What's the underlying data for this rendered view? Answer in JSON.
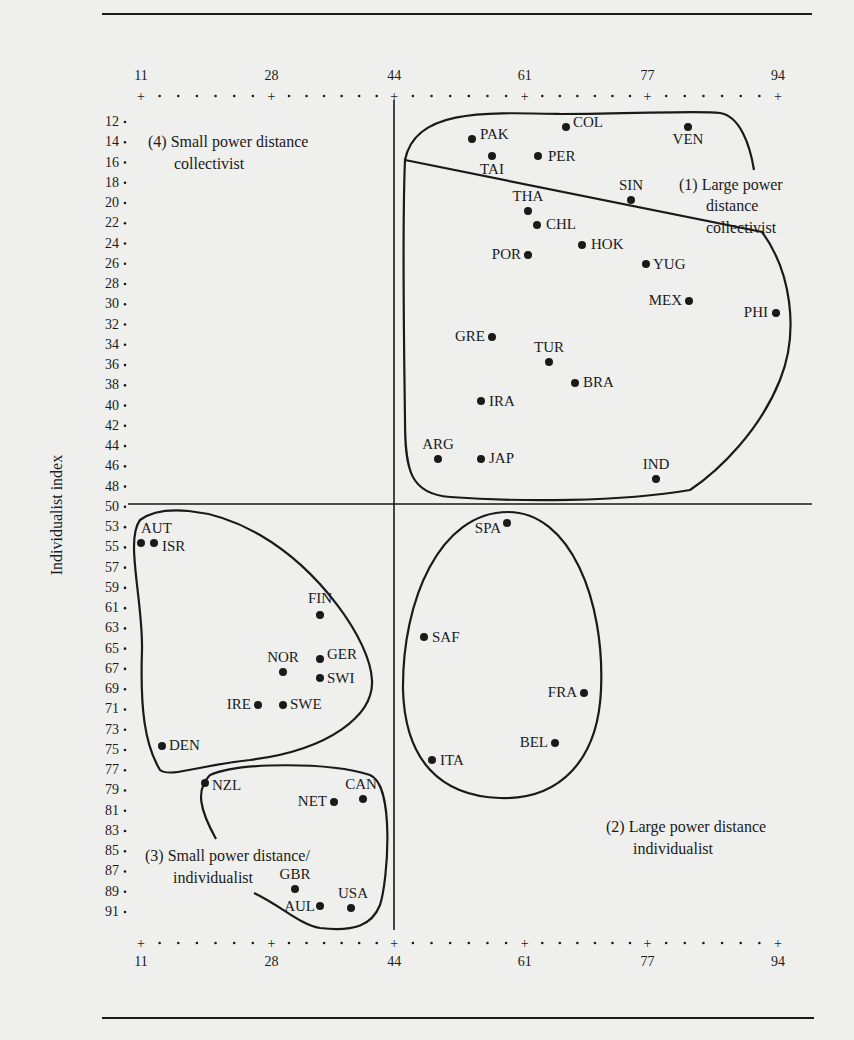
{
  "chart_data": {
    "type": "scatter",
    "title": "",
    "xlabel": "Power distance index",
    "ylabel": "Individualist index",
    "x_ticks": [
      11,
      28,
      44,
      61,
      77,
      94
    ],
    "y_ticks": [
      12,
      14,
      16,
      18,
      20,
      22,
      24,
      26,
      28,
      30,
      32,
      34,
      36,
      38,
      40,
      42,
      44,
      46,
      48,
      50,
      53,
      55,
      57,
      59,
      61,
      63,
      65,
      67,
      69,
      71,
      73,
      75,
      77,
      79,
      81,
      83,
      85,
      87,
      89,
      91
    ],
    "xlim": [
      11,
      94
    ],
    "ylim": [
      12,
      91
    ],
    "y_inverted": true,
    "divider_x": 44,
    "divider_y": 50,
    "regions": [
      {
        "id": "1",
        "label_line1": "(1) Large power",
        "label_line2": "distance",
        "label_line3": "collectivist"
      },
      {
        "id": "2",
        "label_line1": "(2) Large power distance",
        "label_line2": "individualist"
      },
      {
        "id": "3",
        "label_line1": "(3) Small power distance/",
        "label_line2": "individualist"
      },
      {
        "id": "4",
        "label_line1": "(4) Small power distance",
        "label_line2": "collectivist"
      }
    ],
    "points": [
      {
        "label": "PAK",
        "x": 55,
        "y": 14,
        "region": "1"
      },
      {
        "label": "COL",
        "x": 67,
        "y": 13,
        "region": "1"
      },
      {
        "label": "VEN",
        "x": 81,
        "y": 12,
        "region": "1"
      },
      {
        "label": "TAI",
        "x": 58,
        "y": 17,
        "region": "1"
      },
      {
        "label": "PER",
        "x": 64,
        "y": 16,
        "region": "1"
      },
      {
        "label": "SIN",
        "x": 74,
        "y": 20,
        "region": "1"
      },
      {
        "label": "THA",
        "x": 64,
        "y": 20,
        "region": "1"
      },
      {
        "label": "CHL",
        "x": 63,
        "y": 23,
        "region": "1"
      },
      {
        "label": "HOK",
        "x": 68,
        "y": 25,
        "region": "1"
      },
      {
        "label": "POR",
        "x": 63,
        "y": 27,
        "region": "1"
      },
      {
        "label": "YUG",
        "x": 76,
        "y": 27,
        "region": "1"
      },
      {
        "label": "MEX",
        "x": 81,
        "y": 30,
        "region": "1"
      },
      {
        "label": "PHI",
        "x": 94,
        "y": 32,
        "region": "1"
      },
      {
        "label": "GRE",
        "x": 60,
        "y": 35,
        "region": "1"
      },
      {
        "label": "TUR",
        "x": 66,
        "y": 37,
        "region": "1"
      },
      {
        "label": "BRA",
        "x": 69,
        "y": 38,
        "region": "1"
      },
      {
        "label": "IRA",
        "x": 58,
        "y": 41,
        "region": "1"
      },
      {
        "label": "ARG",
        "x": 49,
        "y": 46,
        "region": "1"
      },
      {
        "label": "JAP",
        "x": 54,
        "y": 46,
        "region": "1"
      },
      {
        "label": "IND",
        "x": 77,
        "y": 48,
        "region": "1"
      },
      {
        "label": "SPA",
        "x": 57,
        "y": 51,
        "region": "2"
      },
      {
        "label": "SAF",
        "x": 49,
        "y": 65,
        "region": "2"
      },
      {
        "label": "FRA",
        "x": 68,
        "y": 71,
        "region": "2"
      },
      {
        "label": "BEL",
        "x": 65,
        "y": 75,
        "region": "2"
      },
      {
        "label": "ITA",
        "x": 50,
        "y": 76,
        "region": "2"
      },
      {
        "label": "AUT",
        "x": 11,
        "y": 55,
        "region": "4"
      },
      {
        "label": "ISR",
        "x": 13,
        "y": 54,
        "region": "4"
      },
      {
        "label": "FIN",
        "x": 33,
        "y": 63,
        "region": "4"
      },
      {
        "label": "NOR",
        "x": 31,
        "y": 69,
        "region": "4"
      },
      {
        "label": "GER",
        "x": 35,
        "y": 67,
        "region": "4"
      },
      {
        "label": "SWI",
        "x": 34,
        "y": 68,
        "region": "4"
      },
      {
        "label": "SWE",
        "x": 31,
        "y": 71,
        "region": "4"
      },
      {
        "label": "IRE",
        "x": 28,
        "y": 70,
        "region": "4"
      },
      {
        "label": "DEN",
        "x": 18,
        "y": 74,
        "region": "4"
      },
      {
        "label": "NZL",
        "x": 22,
        "y": 79,
        "region": "3"
      },
      {
        "label": "NET",
        "x": 38,
        "y": 80,
        "region": "3"
      },
      {
        "label": "CAN",
        "x": 39,
        "y": 80,
        "region": "3"
      },
      {
        "label": "GBR",
        "x": 35,
        "y": 89,
        "region": "3"
      },
      {
        "label": "AUL",
        "x": 36,
        "y": 90,
        "region": "3"
      },
      {
        "label": "USA",
        "x": 40,
        "y": 91,
        "region": "3"
      }
    ],
    "grid": false,
    "legend": "none"
  },
  "axis": {
    "y_title": "Individualist index"
  }
}
